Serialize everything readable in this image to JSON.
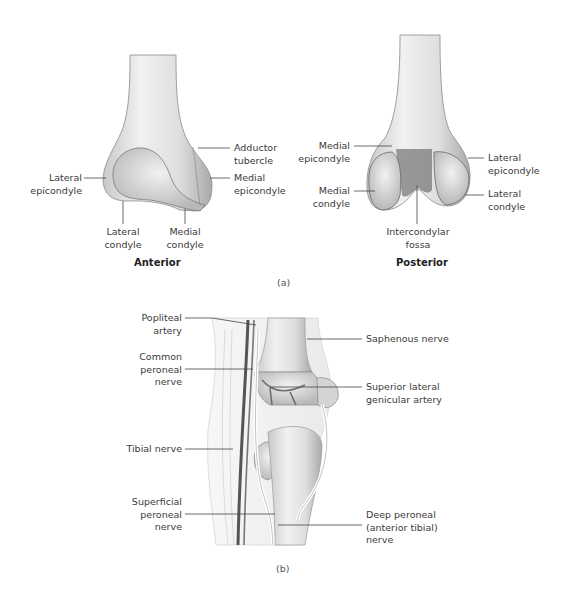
{
  "figure": {
    "panel_a": {
      "letter": "(a)",
      "anterior": {
        "title": "Anterior",
        "labels": {
          "lateral_epicondyle": "Lateral\nepicondyle",
          "adductor_tubercle": "Adductor\ntubercle",
          "medial_epicondyle": "Medial\nepicondyle",
          "lateral_condyle": "Lateral\ncondyle",
          "medial_condyle": "Medial\ncondyle"
        }
      },
      "posterior": {
        "title": "Posterior",
        "labels": {
          "medial_epicondyle": "Medial\nepicondyle",
          "lateral_epicondyle": "Lateral\nepicondyle",
          "medial_condyle": "Medial\ncondyle",
          "lateral_condyle": "Lateral\ncondyle",
          "intercondylar_fossa": "Intercondylar\nfossa"
        }
      }
    },
    "panel_b": {
      "letter": "(b)",
      "labels": {
        "popliteal_artery": "Popliteal\nartery",
        "common_peroneal_nerve": "Common\nperoneal\nnerve",
        "tibial_nerve": "Tibial nerve",
        "superficial_peroneal_nerve": "Superficial\nperoneal\nnerve",
        "saphenous_nerve": "Saphenous nerve",
        "superior_lateral_genicular_artery": "Superior lateral\ngenicular artery",
        "deep_peroneal_nerve": "Deep peroneal\n(anterior tibial)\nnerve"
      }
    }
  }
}
